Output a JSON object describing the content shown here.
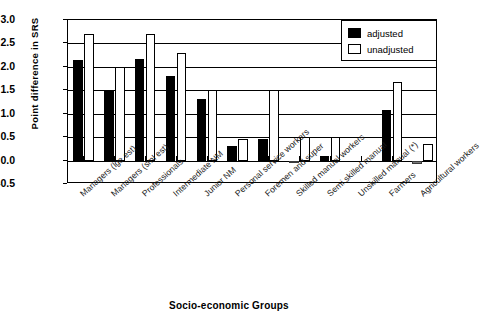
{
  "chart_data": {
    "type": "bar",
    "title": "",
    "xlabel": "Socio-economic Groups",
    "ylabel": "Point difference in SRS",
    "ylim": [
      -0.5,
      3.0
    ],
    "ytick_labels": [
      "3.0",
      "2.5",
      "2.0",
      "1.5",
      "1.0",
      "0.5",
      "0.0",
      "-0.5"
    ],
    "ytick_values": [
      3.0,
      2.5,
      2.0,
      1.5,
      1.0,
      0.5,
      0.0,
      -0.5
    ],
    "grid": true,
    "legend_position": "top-right",
    "categories": [
      "Managers (lge est)",
      "Managers (sml est)",
      "Professionals",
      "Intermediate NM",
      "Junior NM",
      "Personal service workers",
      "Foremen and super",
      "Skilled manual workers",
      "Semi skilled manual",
      "Unskilled manual (*)",
      "Farmers",
      "Agricultural workers"
    ],
    "series": [
      {
        "name": "adjusted",
        "color": "#000000",
        "values": [
          2.15,
          1.5,
          2.16,
          1.8,
          1.31,
          0.32,
          0.45,
          -0.05,
          0.1,
          0.0,
          1.08,
          -0.08
        ]
      },
      {
        "name": "unadjusted",
        "color": "#ffffff",
        "values": [
          2.7,
          2.0,
          2.7,
          2.3,
          1.5,
          0.45,
          1.5,
          0.5,
          0.5,
          0.0,
          1.68,
          0.35
        ]
      }
    ]
  },
  "legend": {
    "items": [
      {
        "label": "adjusted",
        "swatch": "filled-black-square"
      },
      {
        "label": "unadjusted",
        "swatch": "outlined-white-square"
      }
    ]
  }
}
